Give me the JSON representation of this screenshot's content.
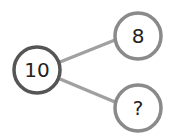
{
  "diagram": {
    "type": "number-bond",
    "whole": {
      "label": "10"
    },
    "parts": [
      {
        "label": "8"
      },
      {
        "label": "?"
      }
    ],
    "colors": {
      "whole_stroke": "#555555",
      "part_stroke": "#8a8a8a",
      "connector": "#a0a0a0",
      "text": "#222222"
    }
  }
}
